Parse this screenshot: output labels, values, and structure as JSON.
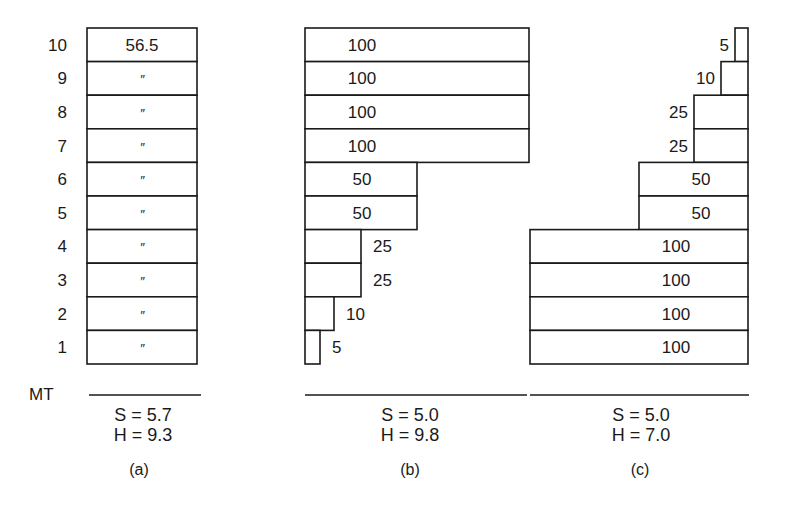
{
  "figure": {
    "row_axis_labels": [
      "1",
      "2",
      "3",
      "4",
      "5",
      "6",
      "7",
      "8",
      "9",
      "10"
    ],
    "baseline_label": "MT",
    "panels": [
      {
        "id": "a",
        "caption": "(a)",
        "align": "uniform",
        "rows": [
          {
            "level": 10,
            "value": 56.5,
            "label": "56.5"
          },
          {
            "level": 9,
            "value": 56.5,
            "label": "″"
          },
          {
            "level": 8,
            "value": 56.5,
            "label": "″"
          },
          {
            "level": 7,
            "value": 56.5,
            "label": "″"
          },
          {
            "level": 6,
            "value": 56.5,
            "label": "″"
          },
          {
            "level": 5,
            "value": 56.5,
            "label": "″"
          },
          {
            "level": 4,
            "value": 56.5,
            "label": "″"
          },
          {
            "level": 3,
            "value": 56.5,
            "label": "″"
          },
          {
            "level": 2,
            "value": 56.5,
            "label": "″"
          },
          {
            "level": 1,
            "value": 56.5,
            "label": "″"
          }
        ],
        "stats": {
          "s": "S = 5.7",
          "h": "H = 9.3"
        }
      },
      {
        "id": "b",
        "caption": "(b)",
        "align": "left",
        "rows": [
          {
            "level": 10,
            "value": 100,
            "label": "100"
          },
          {
            "level": 9,
            "value": 100,
            "label": "100"
          },
          {
            "level": 8,
            "value": 100,
            "label": "100"
          },
          {
            "level": 7,
            "value": 100,
            "label": "100"
          },
          {
            "level": 6,
            "value": 50,
            "label": "50"
          },
          {
            "level": 5,
            "value": 50,
            "label": "50"
          },
          {
            "level": 4,
            "value": 25,
            "label": "25"
          },
          {
            "level": 3,
            "value": 25,
            "label": "25"
          },
          {
            "level": 2,
            "value": 10,
            "label": "10"
          },
          {
            "level": 1,
            "value": 5,
            "label": "5"
          }
        ],
        "stats": {
          "s": "S = 5.0",
          "h": "H = 9.8"
        }
      },
      {
        "id": "c",
        "caption": "(c)",
        "align": "right",
        "rows": [
          {
            "level": 10,
            "value": 5,
            "label": "5"
          },
          {
            "level": 9,
            "value": 10,
            "label": "10"
          },
          {
            "level": 8,
            "value": 25,
            "label": "25"
          },
          {
            "level": 7,
            "value": 25,
            "label": "25"
          },
          {
            "level": 6,
            "value": 50,
            "label": "50"
          },
          {
            "level": 5,
            "value": 50,
            "label": "50"
          },
          {
            "level": 4,
            "value": 100,
            "label": "100"
          },
          {
            "level": 3,
            "value": 100,
            "label": "100"
          },
          {
            "level": 2,
            "value": 100,
            "label": "100"
          },
          {
            "level": 1,
            "value": 100,
            "label": "100"
          }
        ],
        "stats": {
          "s": "S = 5.0",
          "h": "H = 7.0"
        }
      }
    ]
  }
}
